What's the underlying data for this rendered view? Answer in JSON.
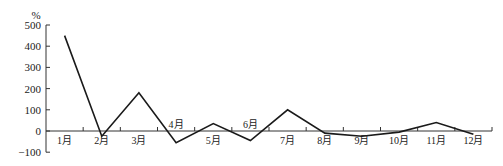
{
  "chart_data": {
    "type": "line",
    "title": "",
    "xlabel": "",
    "ylabel": "%",
    "categories": [
      "1月",
      "2月",
      "3月",
      "4月",
      "5月",
      "6月",
      "7月",
      "8月",
      "9月",
      "10月",
      "11月",
      "12月"
    ],
    "series": [
      {
        "name": "",
        "values": [
          450,
          -25,
          180,
          -55,
          35,
          -45,
          100,
          -10,
          -25,
          -5,
          40,
          -15
        ]
      }
    ],
    "ylim": [
      -100,
      500
    ],
    "yticks": [
      -100,
      0,
      100,
      200,
      300,
      400,
      500
    ],
    "ytick_labels": [
      "−100",
      "0",
      "100",
      "200",
      "300",
      "400",
      "500"
    ],
    "grid": false,
    "legend": "none",
    "label_positions": {
      "4月": "above-axis",
      "6月": "above-axis",
      "others": "below-axis"
    },
    "line_color": "#1a1a1a",
    "axis_color": "#333333"
  }
}
